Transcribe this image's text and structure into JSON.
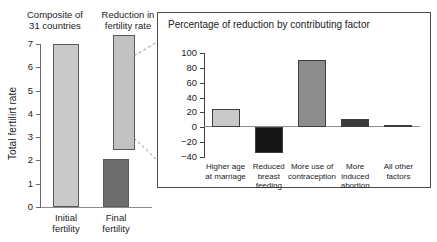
{
  "main": {
    "header_left": "Composite of\n31 countries",
    "header_right": "Reduction in\nfertility rate",
    "y_axis_title": "Total fertilirt rate"
  },
  "inset": {
    "title": "Percentage of reduction by contributing factor"
  },
  "chart_data": [
    {
      "type": "bar",
      "title": "Composite of 31 countries",
      "xlabel": "",
      "ylabel": "Total fertilirt rate",
      "ylim": [
        0,
        7
      ],
      "yticks": [
        "0",
        "1",
        "2",
        "3",
        "4",
        "5",
        "6",
        "7"
      ],
      "grid": false,
      "legend": "none",
      "categories": [
        "Initial\nfertility",
        "Final\nfertility"
      ],
      "values": [
        7.0,
        2.05
      ],
      "colors": [
        "#c9c9c9",
        "#6e6e6e"
      ],
      "annotations": [
        {
          "name": "Reduction in fertility rate",
          "type": "floating-bar",
          "y_bottom": 2.45,
          "y_top": 7.4,
          "color": "#c2c2c2"
        }
      ]
    },
    {
      "type": "bar",
      "title": "Percentage of reduction by contributing factor",
      "xlabel": "",
      "ylabel": "",
      "ylim": [
        -40,
        100
      ],
      "yticks": [
        "100",
        "80",
        "60",
        "40",
        "20",
        "0",
        "−20",
        "−40"
      ],
      "grid": false,
      "legend": "none",
      "categories": [
        "Higher age\nat marriage",
        "Reduced\nbreast\nfeeding",
        "More use of\ncontraception",
        "More\ninduced\nabortion",
        "All other\nfactors"
      ],
      "values": [
        25,
        -35,
        91,
        11,
        3
      ],
      "colors": [
        "#c9c9c9",
        "#151515",
        "#8d8d8d",
        "#3b3b3b",
        "#e2e2e2"
      ]
    }
  ]
}
